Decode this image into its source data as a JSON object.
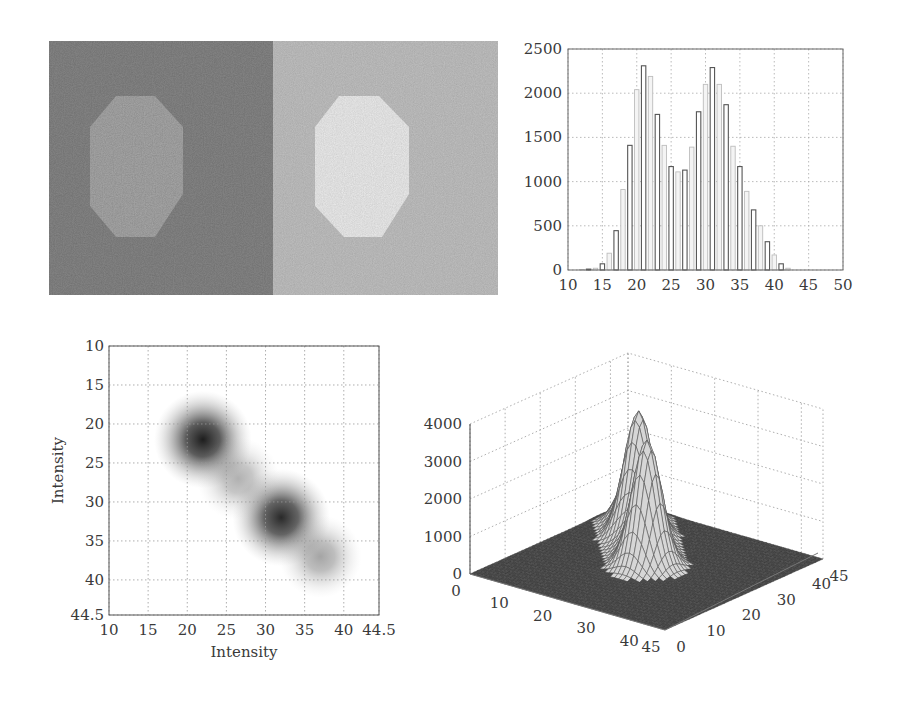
{
  "figure": {
    "panels": [
      {
        "id": "images",
        "description": "Two noisy grayscale images with octagon object: dark image (left) and bright image (right)"
      },
      {
        "id": "histogram"
      },
      {
        "id": "joint_histogram"
      },
      {
        "id": "surface"
      }
    ]
  },
  "images": {
    "left": {
      "background": "#6a6a6a",
      "object": "#8e8e8e"
    },
    "right": {
      "background": "#a5a5a5",
      "object": "#d4d4d4"
    }
  },
  "chart_data": [
    {
      "type": "bar",
      "title": "",
      "xlabel": "",
      "ylabel": "",
      "xlim": [
        10,
        50
      ],
      "ylim": [
        0,
        2500
      ],
      "grid": true,
      "x_ticks": [
        "10",
        "15",
        "20",
        "25",
        "30",
        "35",
        "40",
        "45",
        "50"
      ],
      "y_ticks": [
        "0",
        "500",
        "1000",
        "1500",
        "2000",
        "2500"
      ],
      "categories": [
        12,
        13,
        14,
        15,
        16,
        17,
        18,
        19,
        20,
        21,
        22,
        23,
        24,
        25,
        26,
        27,
        28,
        29,
        30,
        31,
        32,
        33,
        34,
        35,
        36,
        37,
        38,
        39,
        40,
        41,
        42
      ],
      "series": [
        {
          "name": "image histogram",
          "values": [
            5,
            10,
            20,
            70,
            190,
            445,
            910,
            1410,
            2040,
            2310,
            2190,
            1760,
            1410,
            1170,
            1110,
            1130,
            1390,
            1790,
            2100,
            2290,
            2100,
            1870,
            1400,
            1170,
            890,
            680,
            500,
            320,
            170,
            70,
            20
          ]
        }
      ]
    },
    {
      "type": "heatmap",
      "title": "",
      "xlabel": "Intensity",
      "ylabel": "Intensity",
      "xlim": [
        10,
        44.5
      ],
      "ylim": [
        44.5,
        10
      ],
      "grid": true,
      "x_ticks": [
        "10",
        "15",
        "20",
        "25",
        "30",
        "35",
        "40",
        "44.5"
      ],
      "y_ticks": [
        "10",
        "15",
        "20",
        "25",
        "30",
        "35",
        "40",
        "44.5"
      ],
      "clusters": [
        {
          "x": 22,
          "y": 22,
          "intensity": 1.0,
          "spread": 2.6
        },
        {
          "x": 32,
          "y": 32,
          "intensity": 0.95,
          "spread": 2.6
        },
        {
          "x": 26.5,
          "y": 27,
          "intensity": 0.35,
          "spread": 2.2
        },
        {
          "x": 37,
          "y": 37,
          "intensity": 0.4,
          "spread": 2.2
        }
      ]
    },
    {
      "type": "surface",
      "title": "",
      "zlim": [
        0,
        4000
      ],
      "z_ticks": [
        "0",
        "1000",
        "2000",
        "3000",
        "4000"
      ],
      "x_ticks": [
        "0",
        "10",
        "20",
        "30",
        "40",
        "45"
      ],
      "y_ticks": [
        "0",
        "10",
        "20",
        "30",
        "40",
        "45"
      ],
      "grid": true,
      "peaks": [
        {
          "x": 22,
          "y": 22,
          "z": 3350
        },
        {
          "x": 32,
          "y": 32,
          "z": 3300
        },
        {
          "x": 27,
          "y": 27,
          "z": 1150
        },
        {
          "x": 37,
          "y": 37,
          "z": 1450
        }
      ]
    }
  ],
  "labels": {
    "hist_y": [
      "0",
      "500",
      "1000",
      "1500",
      "2000",
      "2500"
    ],
    "hist_x": [
      "10",
      "15",
      "20",
      "25",
      "30",
      "35",
      "40",
      "45",
      "50"
    ],
    "joint_y": [
      "10",
      "15",
      "20",
      "25",
      "30",
      "35",
      "40",
      "44.5"
    ],
    "joint_x": [
      "10",
      "15",
      "20",
      "25",
      "30",
      "35",
      "40",
      "44.5"
    ],
    "joint_xlabel": "Intensity",
    "joint_ylabel": "Intensity",
    "surf_z": [
      "0",
      "1000",
      "2000",
      "3000",
      "4000"
    ],
    "surf_x": [
      "0",
      "10",
      "20",
      "30",
      "40",
      "45"
    ],
    "surf_y": [
      "0",
      "10",
      "20",
      "30",
      "40",
      "45"
    ]
  }
}
